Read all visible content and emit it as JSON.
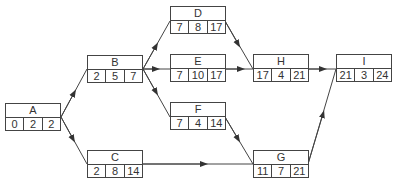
{
  "diagram": {
    "type": "activity-on-node network",
    "nodes": [
      {
        "id": "A",
        "values": [
          "0",
          "2",
          "2"
        ],
        "x": 5,
        "y": 103
      },
      {
        "id": "B",
        "values": [
          "2",
          "5",
          "7"
        ],
        "x": 87,
        "y": 55
      },
      {
        "id": "C",
        "values": [
          "2",
          "8",
          "14"
        ],
        "x": 87,
        "y": 150
      },
      {
        "id": "D",
        "values": [
          "7",
          "8",
          "17"
        ],
        "x": 170,
        "y": 6
      },
      {
        "id": "E",
        "values": [
          "7",
          "10",
          "17"
        ],
        "x": 170,
        "y": 54
      },
      {
        "id": "F",
        "values": [
          "7",
          "4",
          "14"
        ],
        "x": 170,
        "y": 102
      },
      {
        "id": "G",
        "values": [
          "11",
          "7",
          "21"
        ],
        "x": 253,
        "y": 150
      },
      {
        "id": "H",
        "values": [
          "17",
          "4",
          "21"
        ],
        "x": 253,
        "y": 54
      },
      {
        "id": "I",
        "values": [
          "21",
          "3",
          "24"
        ],
        "x": 336,
        "y": 54
      }
    ],
    "edges": [
      [
        "A",
        "B"
      ],
      [
        "A",
        "C"
      ],
      [
        "B",
        "D"
      ],
      [
        "B",
        "E"
      ],
      [
        "B",
        "F"
      ],
      [
        "C",
        "G"
      ],
      [
        "D",
        "H"
      ],
      [
        "E",
        "H"
      ],
      [
        "F",
        "G"
      ],
      [
        "H",
        "I"
      ],
      [
        "G",
        "I"
      ]
    ]
  }
}
